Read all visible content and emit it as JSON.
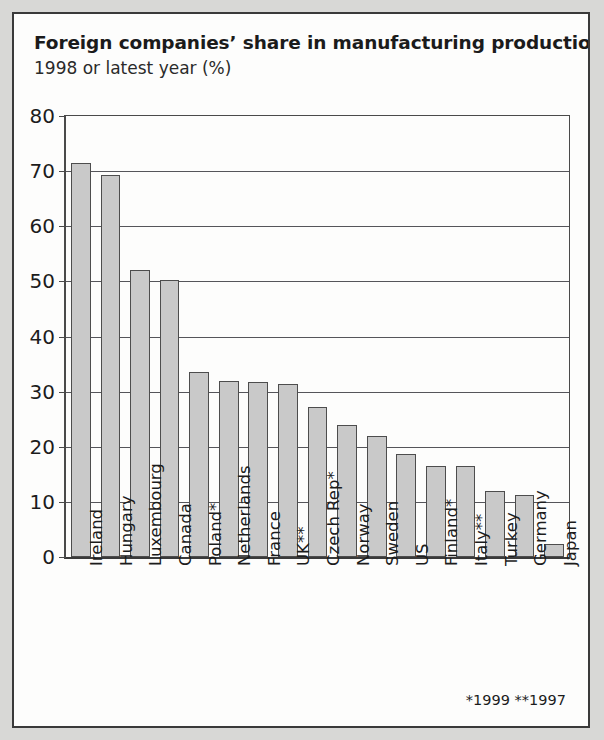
{
  "figure": {
    "title": "Foreign companies’ share in manufacturing production",
    "subtitle": "1998 or latest year (%)",
    "footnote": "*1999 **1997",
    "bar_color": "#c9c9c9",
    "bar_border_color": "#4d4d4d",
    "frame_color": "#3a3a3a",
    "background_color": "#fdfdfc"
  },
  "chart_data": {
    "type": "bar",
    "title": "Foreign companies’ share in manufacturing production",
    "subtitle": "1998 or latest year (%)",
    "xlabel": "",
    "ylabel": "",
    "ylim": [
      0,
      80
    ],
    "yticks": [
      0,
      10,
      20,
      30,
      40,
      50,
      60,
      70,
      80
    ],
    "ytick_labels": [
      "0",
      "10",
      "20",
      "30",
      "40",
      "50",
      "60",
      "70",
      "80"
    ],
    "grid": true,
    "legend": false,
    "orientation": "vertical",
    "categories": [
      "Ireland",
      "Hungary",
      "Luxembourg",
      "Canada",
      "Poland*",
      "Netherlands",
      "France",
      "UK**",
      "Czech Rep*",
      "Norway",
      "Sweden",
      "US",
      "Finland*",
      "Italy**",
      "Turkey",
      "Germany",
      "Japan"
    ],
    "values": [
      71.5,
      69.3,
      52.0,
      50.3,
      33.5,
      32.0,
      31.7,
      31.3,
      27.2,
      24.0,
      22.0,
      18.6,
      16.6,
      16.6,
      12.0,
      11.2,
      2.3
    ],
    "annotations": [
      "*1999 **1997"
    ]
  }
}
